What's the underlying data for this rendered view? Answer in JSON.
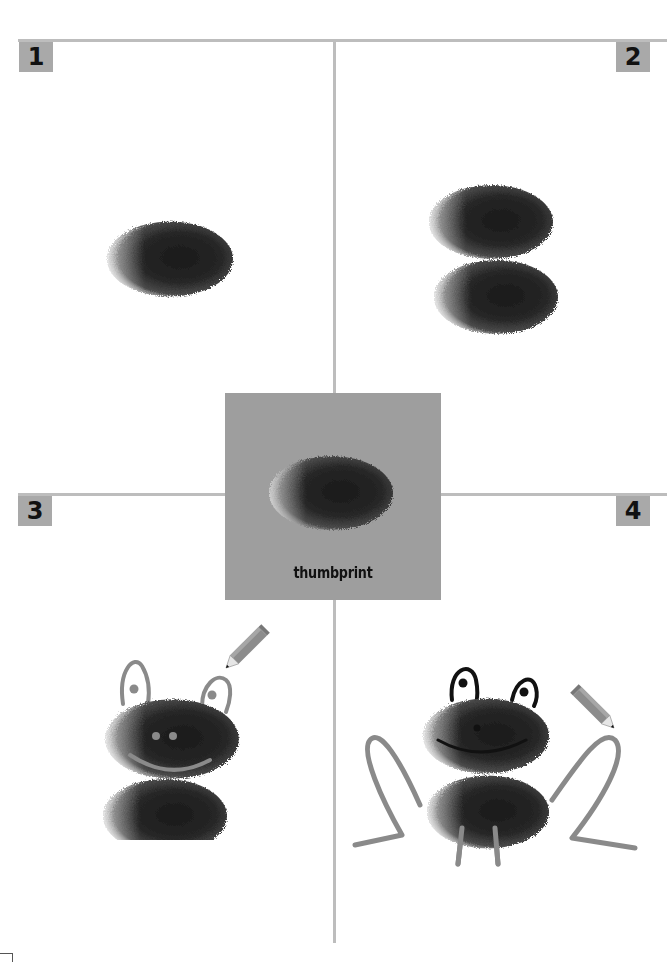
{
  "page": {
    "background": "#ffffff",
    "line_color": "#bdbdbd",
    "badge_color": "#a9a9a9",
    "box_color": "#9e9e9e",
    "stroke_color": "#8a8a8a",
    "ink_color": "#111111"
  },
  "steps": [
    {
      "number": "1",
      "description": "single thumbprint"
    },
    {
      "number": "2",
      "description": "two stacked thumbprints"
    },
    {
      "number": "3",
      "description": "add eyes and smile with pencil"
    },
    {
      "number": "4",
      "description": "add legs, outline eyes and mouth"
    }
  ],
  "center": {
    "label": "thumbprint"
  },
  "icons": {
    "pencil": "pencil-icon",
    "thumbprint": "thumbprint-blob"
  }
}
